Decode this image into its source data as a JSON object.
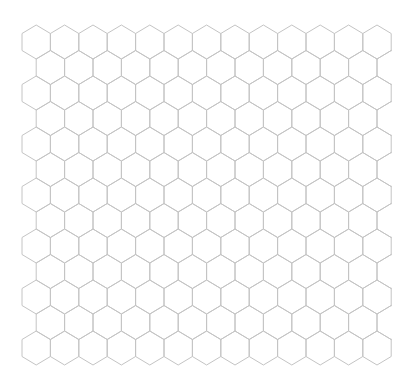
{
  "canvas": {
    "width": 412,
    "height": 386,
    "background": "#ffffff"
  },
  "hex_grid": {
    "orientation": "pointy-top",
    "rows": 13,
    "columns_per_row": 13,
    "origin_x": 22,
    "origin_y": 25,
    "hex_width": 28.4,
    "side_height": 17,
    "cap_height": 8.5,
    "row_pitch": 25.5,
    "odd_row_offset": 14.2,
    "clip_right": 392,
    "stroke_color": "#c4c4c4",
    "fill_color": "none"
  }
}
